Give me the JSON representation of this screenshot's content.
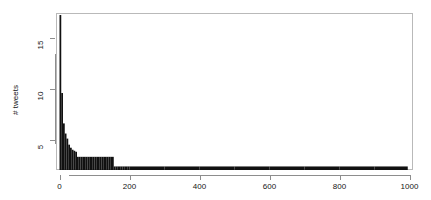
{
  "chart_data": {
    "type": "bar",
    "title": "",
    "subtitle": "",
    "xlabel": "",
    "ylabel": "# tweets",
    "xlim": [
      -10,
      1010
    ],
    "ylim": [
      2,
      17.5
    ],
    "grid": false,
    "legend": false,
    "bar_color": "#111111",
    "frame_color": "#b9b9b9",
    "axis_color": "#8d8d8d",
    "xticks": [
      0,
      200,
      400,
      600,
      800,
      1000
    ],
    "xtick_labels": [
      "0",
      "200",
      "400",
      "600",
      "800",
      "1000"
    ],
    "yticks": [
      5,
      10,
      15
    ],
    "ytick_labels": [
      "5",
      "10",
      "15"
    ],
    "bin_width": 5,
    "note": "Right-skewed / power-law histogram of tweet counts. Bin left edges in 'x', bar heights in 'values'.",
    "x": [
      0,
      5,
      10,
      15,
      20,
      25,
      30,
      35,
      40,
      45,
      50,
      55,
      60,
      65,
      70,
      75,
      80,
      85,
      90,
      95,
      100,
      105,
      110,
      115,
      120,
      125,
      130,
      135,
      140,
      145,
      150,
      155,
      160,
      165,
      170,
      175,
      180,
      185,
      190,
      195,
      200,
      250,
      300,
      350,
      400,
      450,
      500,
      550,
      600,
      650,
      700,
      750,
      800,
      850,
      900,
      950,
      990
    ],
    "values": [
      17.3,
      9.6,
      6.6,
      5.6,
      5.1,
      4.5,
      4.2,
      4.0,
      3.9,
      3.8,
      3.3,
      3.3,
      3.3,
      3.3,
      3.3,
      3.3,
      3.3,
      3.3,
      3.3,
      3.3,
      3.3,
      3.3,
      3.3,
      3.3,
      3.3,
      3.3,
      3.3,
      3.3,
      3.3,
      3.3,
      3.3,
      2.35,
      2.35,
      2.35,
      2.35,
      2.35,
      2.35,
      2.35,
      2.35,
      2.35,
      2.35,
      2.35,
      2.35,
      2.35,
      2.35,
      2.35,
      2.35,
      2.35,
      2.35,
      2.35,
      2.35,
      2.35,
      2.35,
      2.35,
      2.35,
      2.35,
      2.35
    ]
  }
}
